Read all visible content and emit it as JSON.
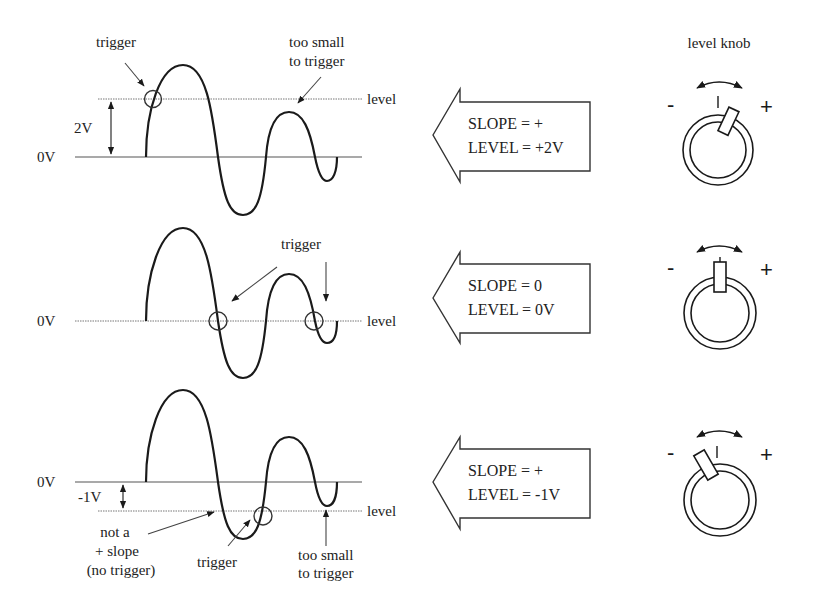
{
  "header": {
    "knob_title": "level knob"
  },
  "panels": [
    {
      "zero_label": "0V",
      "offset_label": "2V",
      "level_label": "level",
      "annotations": {
        "trigger": "trigger",
        "too_small_line1": "too small",
        "too_small_line2": "to trigger"
      },
      "settings": {
        "slope": "SLOPE = +",
        "level": "LEVEL = +2V"
      },
      "knob": {
        "minus": "-",
        "plus": "+",
        "angle_deg": 25
      }
    },
    {
      "zero_label": "0V",
      "level_label": "level",
      "annotations": {
        "trigger": "trigger"
      },
      "settings": {
        "slope": "SLOPE = 0",
        "level": "LEVEL = 0V"
      },
      "knob": {
        "minus": "-",
        "plus": "+",
        "angle_deg": 0
      }
    },
    {
      "zero_label": "0V",
      "offset_label": "-1V",
      "level_label": "level",
      "annotations": {
        "not_slope_line1": "not a",
        "not_slope_line2": "+ slope",
        "not_slope_line3": "(no trigger)",
        "trigger": "trigger",
        "too_small_line1": "too small",
        "too_small_line2": "to trigger"
      },
      "settings": {
        "slope": "SLOPE = +",
        "level": "LEVEL = -1V"
      },
      "knob": {
        "minus": "-",
        "plus": "+",
        "angle_deg": -30
      }
    }
  ],
  "colors": {
    "line": "#1a1a1a",
    "background": "#ffffff"
  }
}
